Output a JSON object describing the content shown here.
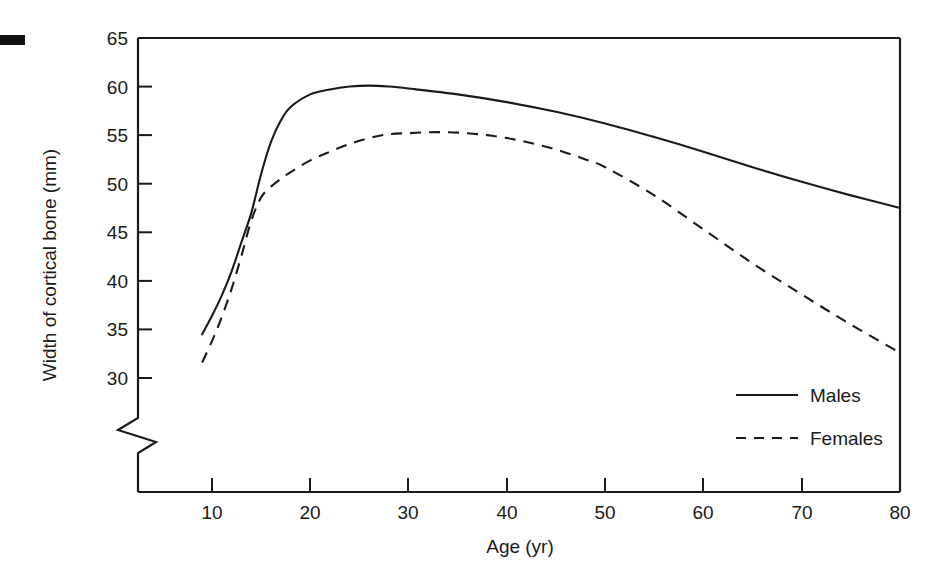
{
  "chart_data": {
    "type": "line",
    "title": "",
    "xlabel": "Age (yr)",
    "ylabel": "Width of cortical bone (mm)",
    "xlim": [
      0,
      80
    ],
    "ylim": [
      28,
      65
    ],
    "ybreak": true,
    "ybreak_note": "axis break between 0 and 28 shown as zigzag on y-axis",
    "grid": false,
    "legend_position": "inside lower right",
    "xticks": [
      10,
      20,
      30,
      40,
      50,
      60,
      70,
      80
    ],
    "xtick_labels": [
      "10",
      "20",
      "30",
      "40",
      "50",
      "60",
      "70",
      "80"
    ],
    "yticks": [
      30,
      35,
      40,
      45,
      50,
      55,
      60,
      65
    ],
    "ytick_labels": [
      "30",
      "35",
      "40",
      "45",
      "50",
      "55",
      "60",
      "65"
    ],
    "series": [
      {
        "name": "Males",
        "style": "solid",
        "color": "#1a1a1a",
        "x": [
          9,
          10,
          11,
          12,
          13,
          14,
          15,
          16,
          17,
          18,
          20,
          22,
          24,
          26,
          28,
          30,
          35,
          40,
          45,
          50,
          55,
          60,
          65,
          70,
          75,
          80
        ],
        "y": [
          34.5,
          36.4,
          38.5,
          41.0,
          44.0,
          47.0,
          51.0,
          54.3,
          56.5,
          57.9,
          59.2,
          59.7,
          60.0,
          60.1,
          60.0,
          59.8,
          59.2,
          58.4,
          57.4,
          56.2,
          54.8,
          53.3,
          51.7,
          50.2,
          48.8,
          47.5
        ]
      },
      {
        "name": "Females",
        "style": "dashed",
        "color": "#1a1a1a",
        "x": [
          9,
          10,
          11,
          12,
          13,
          14,
          15,
          16,
          17,
          18,
          20,
          22,
          24,
          26,
          28,
          30,
          32,
          34,
          36,
          38,
          40,
          42,
          44,
          46,
          48,
          50,
          55,
          60,
          65,
          70,
          75,
          80
        ],
        "y": [
          31.6,
          33.8,
          36.3,
          39.2,
          42.6,
          46.2,
          48.6,
          49.7,
          50.5,
          51.2,
          52.4,
          53.3,
          54.1,
          54.7,
          55.1,
          55.2,
          55.3,
          55.3,
          55.2,
          55.0,
          54.7,
          54.3,
          53.8,
          53.2,
          52.5,
          51.7,
          48.8,
          45.3,
          41.8,
          38.6,
          35.5,
          32.6
        ]
      }
    ],
    "annotations": []
  },
  "legend": {
    "entries": [
      {
        "label": "Males",
        "style": "solid"
      },
      {
        "label": "Females",
        "style": "dashed"
      }
    ]
  },
  "axes": {
    "x_title": "Age (yr)",
    "y_title": "Width of cortical bone (mm)"
  },
  "marks": {
    "corner_mark": "black-rectangle-marker"
  }
}
